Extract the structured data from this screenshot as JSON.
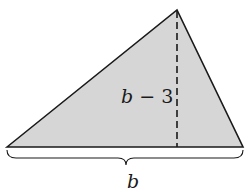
{
  "figure": {
    "shape": "triangle",
    "fill_color": "#d6d6d6",
    "stroke_color": "#1a1a1a",
    "vertices": {
      "left": [
        7,
        147
      ],
      "apex": [
        177,
        10
      ],
      "right": [
        243,
        147
      ]
    },
    "height_line": {
      "style": "dashed",
      "x": 177,
      "y_top": 10,
      "y_bottom": 147
    }
  },
  "labels": {
    "height_var": "b",
    "height_op": "− 3",
    "base": "b"
  }
}
